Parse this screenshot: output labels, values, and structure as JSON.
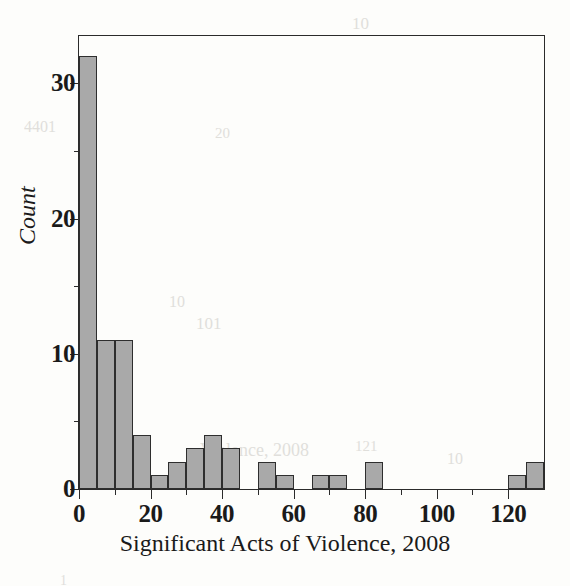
{
  "figure": {
    "kind": "histogram-figure",
    "background_color": "#fdfdfb",
    "bar_fill_color": "#a9a9a9",
    "bar_edge_color": "#2e2e2e",
    "axis_color": "#2b2b2b"
  },
  "axes": {
    "x_title": "Significant Acts of Violence, 2008",
    "y_title": "Count",
    "x_ticks_major": [
      "0",
      "20",
      "40",
      "60",
      "80",
      "100",
      "120"
    ],
    "x_ticks_major_values": [
      0,
      20,
      40,
      60,
      80,
      100,
      120
    ],
    "x_ticks_minor_values": [
      10,
      30,
      50,
      70,
      90,
      110
    ],
    "y_ticks_major": [
      "0",
      "10",
      "20",
      "30"
    ],
    "y_ticks_major_values": [
      0,
      10,
      20,
      30
    ],
    "y_ticks_minor_values": [
      5,
      15,
      25
    ]
  },
  "bleed_through": [
    {
      "text": "10",
      "x": 352,
      "y": 14,
      "size": 17
    },
    {
      "text": "4401",
      "x": 24,
      "y": 118,
      "size": 16
    },
    {
      "text": "20",
      "x": 215,
      "y": 125,
      "size": 15
    },
    {
      "text": "1",
      "x": 27,
      "y": 207,
      "size": 15
    },
    {
      "text": "10",
      "x": 169,
      "y": 293,
      "size": 16
    },
    {
      "text": "101",
      "x": 196,
      "y": 314,
      "size": 17
    },
    {
      "text": "Violence, 2008",
      "x": 200,
      "y": 440,
      "size": 18
    },
    {
      "text": "10",
      "x": 447,
      "y": 450,
      "size": 16
    },
    {
      "text": "121",
      "x": 355,
      "y": 438,
      "size": 15
    },
    {
      "text": "1",
      "x": 60,
      "y": 573,
      "size": 14
    }
  ],
  "chart_data": {
    "type": "bar",
    "title": "",
    "subtitle": "",
    "xlabel": "Significant Acts of Violence, 2008",
    "ylabel": "Count",
    "xlim": [
      0,
      130
    ],
    "ylim": [
      0,
      33.5
    ],
    "bin_width": 5,
    "grid": false,
    "legend": null,
    "bins": [
      {
        "start": 0,
        "end": 5,
        "count": 32
      },
      {
        "start": 5,
        "end": 10,
        "count": 11
      },
      {
        "start": 10,
        "end": 15,
        "count": 11
      },
      {
        "start": 15,
        "end": 20,
        "count": 4
      },
      {
        "start": 20,
        "end": 25,
        "count": 1
      },
      {
        "start": 25,
        "end": 30,
        "count": 2
      },
      {
        "start": 30,
        "end": 35,
        "count": 3
      },
      {
        "start": 35,
        "end": 40,
        "count": 4
      },
      {
        "start": 40,
        "end": 45,
        "count": 3
      },
      {
        "start": 45,
        "end": 50,
        "count": 0
      },
      {
        "start": 50,
        "end": 55,
        "count": 2
      },
      {
        "start": 55,
        "end": 60,
        "count": 1
      },
      {
        "start": 60,
        "end": 65,
        "count": 0
      },
      {
        "start": 65,
        "end": 70,
        "count": 1
      },
      {
        "start": 70,
        "end": 75,
        "count": 1
      },
      {
        "start": 75,
        "end": 80,
        "count": 0
      },
      {
        "start": 80,
        "end": 85,
        "count": 2
      },
      {
        "start": 85,
        "end": 90,
        "count": 0
      },
      {
        "start": 90,
        "end": 95,
        "count": 0
      },
      {
        "start": 95,
        "end": 100,
        "count": 0
      },
      {
        "start": 100,
        "end": 105,
        "count": 0
      },
      {
        "start": 105,
        "end": 110,
        "count": 0
      },
      {
        "start": 110,
        "end": 115,
        "count": 0
      },
      {
        "start": 115,
        "end": 120,
        "count": 0
      },
      {
        "start": 120,
        "end": 125,
        "count": 1
      },
      {
        "start": 125,
        "end": 130,
        "count": 2
      }
    ],
    "categories": [
      "0-5",
      "5-10",
      "10-15",
      "15-20",
      "20-25",
      "25-30",
      "30-35",
      "35-40",
      "40-45",
      "45-50",
      "50-55",
      "55-60",
      "60-65",
      "65-70",
      "70-75",
      "75-80",
      "80-85",
      "85-90",
      "90-95",
      "95-100",
      "100-105",
      "105-110",
      "110-115",
      "115-120",
      "120-125",
      "125-130"
    ],
    "values": [
      32,
      11,
      11,
      4,
      1,
      2,
      3,
      4,
      3,
      0,
      2,
      1,
      0,
      1,
      1,
      0,
      2,
      0,
      0,
      0,
      0,
      0,
      0,
      0,
      1,
      2
    ]
  }
}
